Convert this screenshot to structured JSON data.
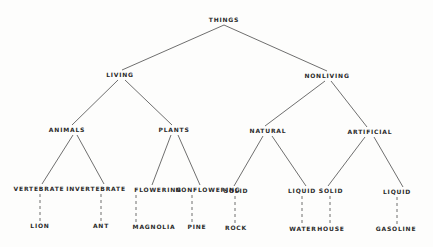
{
  "diagram": {
    "type": "tree",
    "colors": {
      "line": "#4a4a4a",
      "text": "#2a2a2a",
      "background": "#fdfdfc"
    },
    "nodes": [
      {
        "id": "things",
        "label": "THINGS",
        "x": 224,
        "y": 20
      },
      {
        "id": "living",
        "label": "LIVING",
        "x": 120,
        "y": 75
      },
      {
        "id": "nonliving",
        "label": "NONLIVING",
        "x": 327,
        "y": 76
      },
      {
        "id": "animals",
        "label": "ANIMALS",
        "x": 67,
        "y": 130
      },
      {
        "id": "plants",
        "label": "PLANTS",
        "x": 174,
        "y": 130
      },
      {
        "id": "natural",
        "label": "NATURAL",
        "x": 268,
        "y": 131
      },
      {
        "id": "artificial",
        "label": "ARTIFICIAL",
        "x": 370,
        "y": 132
      },
      {
        "id": "vertebrate",
        "label": "VERTEBRATE",
        "x": 39,
        "y": 189
      },
      {
        "id": "invertebrate",
        "label": "INVERTEBRATE",
        "x": 96,
        "y": 189
      },
      {
        "id": "flowering",
        "label": "FLOWERING",
        "x": 158,
        "y": 190
      },
      {
        "id": "nonflowering",
        "label": "NONFLOWERING",
        "x": 208,
        "y": 190
      },
      {
        "id": "natural_solid",
        "label": "SOLID",
        "x": 236,
        "y": 191
      },
      {
        "id": "natural_liquid",
        "label": "LIQUID",
        "x": 302,
        "y": 191
      },
      {
        "id": "artificial_solid",
        "label": "SOLID",
        "x": 331,
        "y": 191
      },
      {
        "id": "artificial_liquid",
        "label": "LIQUID",
        "x": 397,
        "y": 192
      },
      {
        "id": "lion",
        "label": "LION",
        "x": 40,
        "y": 226
      },
      {
        "id": "ant",
        "label": "ANT",
        "x": 101,
        "y": 226
      },
      {
        "id": "magnolia",
        "label": "MAGNOLIA",
        "x": 154,
        "y": 227
      },
      {
        "id": "pine",
        "label": "PINE",
        "x": 197,
        "y": 227
      },
      {
        "id": "rock",
        "label": "ROCK",
        "x": 236,
        "y": 228
      },
      {
        "id": "water",
        "label": "WATER",
        "x": 303,
        "y": 229
      },
      {
        "id": "house",
        "label": "HOUSE",
        "x": 331,
        "y": 229
      },
      {
        "id": "gasoline",
        "label": "GASOLINE",
        "x": 396,
        "y": 229
      }
    ],
    "edges": [
      {
        "from": [
          224,
          25
        ],
        "to": [
          122,
          70
        ],
        "style": "solid"
      },
      {
        "from": [
          224,
          25
        ],
        "to": [
          327,
          71
        ],
        "style": "solid"
      },
      {
        "from": [
          118,
          80
        ],
        "to": [
          72,
          125
        ],
        "style": "solid"
      },
      {
        "from": [
          125,
          80
        ],
        "to": [
          172,
          125
        ],
        "style": "solid"
      },
      {
        "from": [
          325,
          81
        ],
        "to": [
          265,
          126
        ],
        "style": "solid"
      },
      {
        "from": [
          331,
          81
        ],
        "to": [
          367,
          127
        ],
        "style": "solid"
      },
      {
        "from": [
          73,
          135
        ],
        "to": [
          42,
          184
        ],
        "style": "solid"
      },
      {
        "from": [
          77,
          135
        ],
        "to": [
          104,
          184
        ],
        "style": "solid"
      },
      {
        "from": [
          171,
          135
        ],
        "to": [
          152,
          185
        ],
        "style": "solid"
      },
      {
        "from": [
          178,
          135
        ],
        "to": [
          200,
          185
        ],
        "style": "solid"
      },
      {
        "from": [
          263,
          136
        ],
        "to": [
          234,
          186
        ],
        "style": "solid"
      },
      {
        "from": [
          272,
          136
        ],
        "to": [
          306,
          186
        ],
        "style": "solid"
      },
      {
        "from": [
          365,
          137
        ],
        "to": [
          328,
          186
        ],
        "style": "solid"
      },
      {
        "from": [
          374,
          137
        ],
        "to": [
          403,
          187
        ],
        "style": "solid"
      },
      {
        "from": [
          40,
          194
        ],
        "to": [
          40,
          221
        ],
        "style": "dashed"
      },
      {
        "from": [
          101,
          194
        ],
        "to": [
          101,
          221
        ],
        "style": "dashed"
      },
      {
        "from": [
          136,
          195
        ],
        "to": [
          136,
          222
        ],
        "style": "dashed"
      },
      {
        "from": [
          192,
          195
        ],
        "to": [
          192,
          222
        ],
        "style": "dashed"
      },
      {
        "from": [
          235,
          196
        ],
        "to": [
          235,
          223
        ],
        "style": "dashed"
      },
      {
        "from": [
          302,
          196
        ],
        "to": [
          302,
          224
        ],
        "style": "dashed"
      },
      {
        "from": [
          330,
          196
        ],
        "to": [
          330,
          224
        ],
        "style": "dashed"
      },
      {
        "from": [
          397,
          197
        ],
        "to": [
          397,
          224
        ],
        "style": "dashed"
      }
    ]
  }
}
